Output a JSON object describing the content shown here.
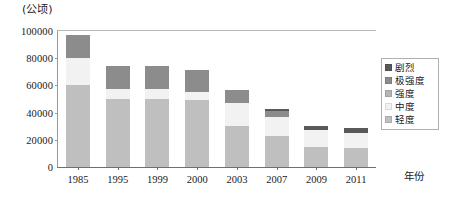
{
  "unit_caption": "(公顷)",
  "x_axis_title": "年份",
  "legend": {
    "items": [
      {
        "label": "剧烈",
        "color": "#595959"
      },
      {
        "label": "极强度",
        "color": "#8c8c8c"
      },
      {
        "label": "强度",
        "color": "#b5b5b5"
      },
      {
        "label": "中度",
        "color": "#f2f2f2"
      },
      {
        "label": "轻度",
        "color": "#bfbfbf"
      }
    ]
  },
  "chart_data": {
    "type": "bar",
    "title": "",
    "subtitle": "",
    "xlabel": "年份",
    "ylabel": "(公顷)",
    "stacked": true,
    "grid": false,
    "legend_position": "right",
    "ylim": [
      0,
      100000
    ],
    "yticks": [
      0,
      20000,
      40000,
      60000,
      80000,
      100000
    ],
    "ytick_labels": [
      "0",
      "20000",
      "40000",
      "60000",
      "80000",
      "100000"
    ],
    "categories": [
      "1985",
      "1995",
      "1999",
      "2000",
      "2003",
      "2007",
      "2009",
      "2011"
    ],
    "series": [
      {
        "name": "轻度",
        "color": "#bfbfbf",
        "values": [
          60000,
          50000,
          50000,
          49000,
          30000,
          23000,
          15000,
          14000
        ]
      },
      {
        "name": "中度",
        "color": "#f2f2f2",
        "values": [
          20000,
          7000,
          7000,
          6000,
          17000,
          14000,
          12000,
          11000
        ]
      },
      {
        "name": "强度",
        "color": "#b5b5b5",
        "values": [
          0,
          0,
          0,
          0,
          0,
          0,
          0,
          0
        ]
      },
      {
        "name": "极强度",
        "color": "#8c8c8c",
        "values": [
          17000,
          17000,
          17000,
          16000,
          10000,
          4000,
          0,
          0
        ]
      },
      {
        "name": "剧烈",
        "color": "#595959",
        "values": [
          0,
          0,
          0,
          0,
          0,
          1500,
          3500,
          3500
        ]
      }
    ],
    "totals": [
      97000,
      74000,
      74000,
      71000,
      57000,
      42500,
      30500,
      28500
    ]
  }
}
